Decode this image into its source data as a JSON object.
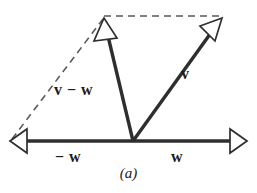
{
  "figure": {
    "caption": "(a)",
    "colors": {
      "solid_line": "#2e2e2e",
      "dashed_line": "#5a5a5a",
      "arrowhead_fill": "#ffffff",
      "arrowhead_stroke": "#2e2e2e",
      "background": "#ffffff",
      "text": "#1c1c1c"
    },
    "labels": {
      "v_minus_w": "v − w",
      "v": "v",
      "negative_w": "− w",
      "w": "w"
    },
    "geometry": {
      "origin": [
        133,
        141
      ],
      "w_tip": [
        247,
        141
      ],
      "neg_w_tip": [
        10,
        141
      ],
      "v_tip": [
        222,
        18
      ],
      "v_minus_w_tip": [
        104,
        18
      ],
      "dashed_top_from": [
        104,
        16
      ],
      "dashed_top_to": [
        222,
        16
      ],
      "dashed_diagonal_from": [
        12,
        139
      ],
      "dashed_diagonal_to": [
        103,
        19
      ]
    },
    "vectors": [
      {
        "name": "negative-w",
        "label": "− w",
        "style": "solid",
        "from": [
          133,
          141
        ],
        "to": [
          10,
          141
        ],
        "arrowhead": "hollow"
      },
      {
        "name": "w",
        "label": "w",
        "style": "solid",
        "from": [
          133,
          141
        ],
        "to": [
          247,
          141
        ],
        "arrowhead": "hollow"
      },
      {
        "name": "v",
        "label": "v",
        "style": "solid",
        "from": [
          133,
          141
        ],
        "to": [
          222,
          18
        ],
        "arrowhead": "hollow"
      },
      {
        "name": "v-minus-w",
        "label": "v − w",
        "style": "solid",
        "from": [
          133,
          141
        ],
        "to": [
          104,
          18
        ],
        "arrowhead": "hollow"
      }
    ],
    "construction_lines": [
      {
        "name": "dashed-top",
        "style": "dashed",
        "from": [
          104,
          16
        ],
        "to": [
          222,
          16
        ]
      },
      {
        "name": "dashed-diagonal",
        "style": "dashed",
        "from": [
          12,
          139
        ],
        "to": [
          103,
          19
        ]
      }
    ]
  }
}
